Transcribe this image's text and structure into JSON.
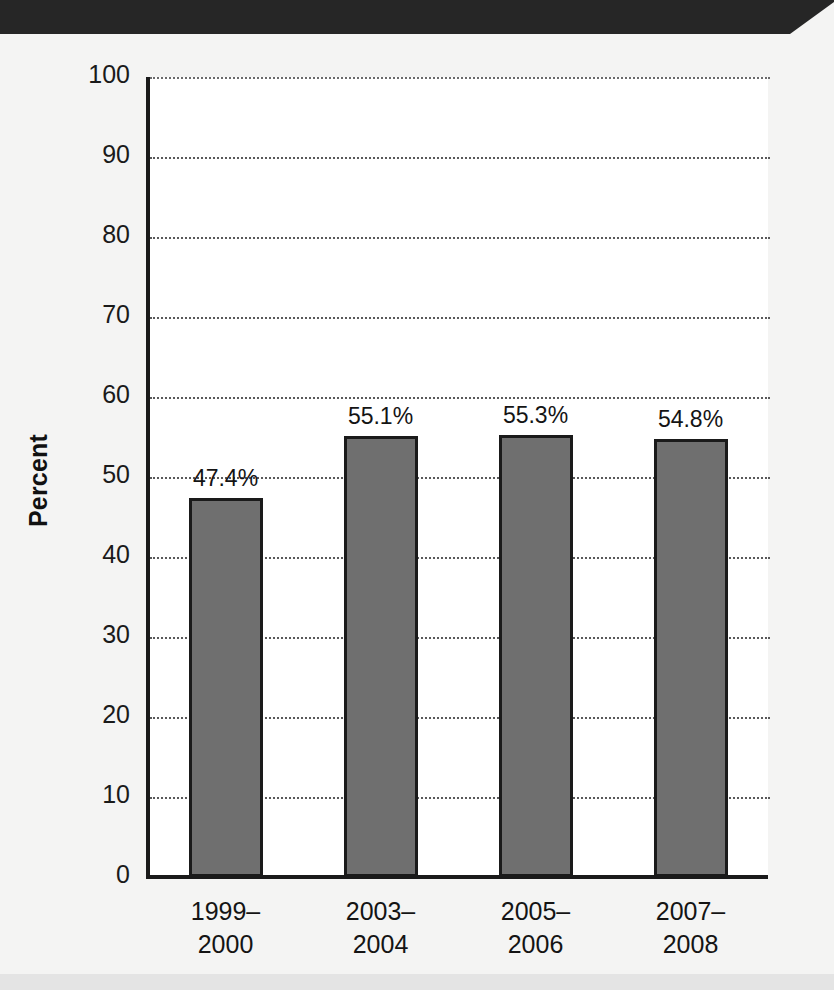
{
  "figure": {
    "background_color": "#f4f4f3",
    "banner_color": "#262626",
    "bar_fill_color": "#6f6f6f",
    "bar_edge_color": "#1a1a1a",
    "gridline_color": "#59595a"
  },
  "chart_data": {
    "type": "bar",
    "title": "",
    "xlabel": "",
    "ylabel": "Percent",
    "ylim": [
      0,
      100
    ],
    "yticks": [
      0,
      10,
      20,
      30,
      40,
      50,
      60,
      70,
      80,
      90,
      100
    ],
    "ytick_labels": [
      "0",
      "10",
      "20",
      "30",
      "40",
      "50",
      "60",
      "70",
      "80",
      "90",
      "100"
    ],
    "grid": true,
    "legend": false,
    "categories": [
      "1999–2000",
      "2003–2004",
      "2005–2006",
      "2007–2008"
    ],
    "category_lines": [
      [
        "1999–",
        "2000"
      ],
      [
        "2003–",
        "2004"
      ],
      [
        "2005–",
        "2006"
      ],
      [
        "2007–",
        "2008"
      ]
    ],
    "values": [
      47.4,
      55.1,
      55.3,
      54.8
    ],
    "data_labels": [
      "47.4%",
      "55.1%",
      "55.3%",
      "54.8%"
    ]
  }
}
